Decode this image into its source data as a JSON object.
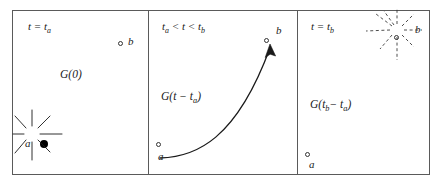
{
  "figure": {
    "caption": "",
    "background_color": "#ffffff",
    "frame_color": "#5a5a5a"
  },
  "panels": [
    {
      "id": "panel-1",
      "time_label": "t = tₐ",
      "time_label_parts": {
        "prefix": "t = t",
        "subscript": "a"
      },
      "green_label": "G(0)",
      "source_point": {
        "name": "a",
        "style": "filled",
        "color": "#000000",
        "burst": "solid",
        "ray_count": 8
      },
      "other_point": {
        "name": "b",
        "style": "open",
        "color": "#333333"
      }
    },
    {
      "id": "panel-2",
      "time_label": "tₐ < t < t_b",
      "time_label_parts": {
        "t_a": "t",
        "sub_a": "a",
        "lt1": " < ",
        "t": "t",
        "lt2": " < ",
        "t_b": "t",
        "sub_b": "b"
      },
      "green_label": "G(t − tₐ)",
      "green_label_parts": {
        "prefix": "G(t − t",
        "subscript": "a",
        "suffix": ")"
      },
      "source_point": {
        "name": "a",
        "style": "open",
        "color": "#333333"
      },
      "target_point": {
        "name": "b",
        "style": "open",
        "color": "#333333"
      },
      "arrow": {
        "type": "curved",
        "direction": "a-to-b",
        "color": "#1a1a1a"
      }
    },
    {
      "id": "panel-3",
      "time_label": "t = t_b",
      "time_label_parts": {
        "prefix": "t = t",
        "subscript": "b"
      },
      "green_label": "G(t_b − tₐ)",
      "green_label_parts": {
        "prefix": "G(t",
        "sub1": "b",
        "mid": " − t",
        "sub2": "a",
        "suffix": ")"
      },
      "source_point": {
        "name": "a",
        "style": "open",
        "color": "#333333"
      },
      "target_point": {
        "name": "b",
        "style": "open",
        "color": "#333333",
        "burst": "dashed",
        "ray_count": 9
      }
    }
  ],
  "labels": {
    "panel1_time_prefix": "t = t",
    "panel1_time_sub": "a",
    "panel1_green": "G(0)",
    "panel1_point_b": "b",
    "panel1_point_a": "a",
    "panel2_t_a": "t",
    "panel2_sub_a": "a",
    "panel2_lt1": " < ",
    "panel2_t": "t",
    "panel2_lt2": " < ",
    "panel2_t_b": "t",
    "panel2_sub_b": "b",
    "panel2_green_prefix": "G(t − t",
    "panel2_green_sub": "a",
    "panel2_green_suffix": ")",
    "panel2_point_a": "a",
    "panel2_point_b": "b",
    "panel3_time_prefix": "t = t",
    "panel3_time_sub": "b",
    "panel3_green_prefix": "G(t",
    "panel3_green_sub1": "b",
    "panel3_green_mid": "− t",
    "panel3_green_sub2": "a",
    "panel3_green_suffix": ")",
    "panel3_point_a": "a",
    "panel3_point_b": "b"
  }
}
